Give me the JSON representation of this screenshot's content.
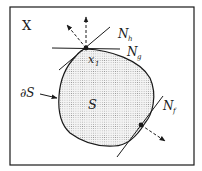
{
  "diagram": {
    "space_label": "X",
    "set_label": "S",
    "boundary_label": "∂S",
    "point_label": "x",
    "point_subscript": "1",
    "normal_cones": [
      {
        "label": "N",
        "subscript": "h"
      },
      {
        "label": "N",
        "subscript": "g"
      },
      {
        "label": "N",
        "subscript": "f"
      }
    ],
    "colors": {
      "stroke": "#1a1a1a",
      "fill_dots": "#8a8a8a",
      "background": "#ffffff"
    }
  }
}
